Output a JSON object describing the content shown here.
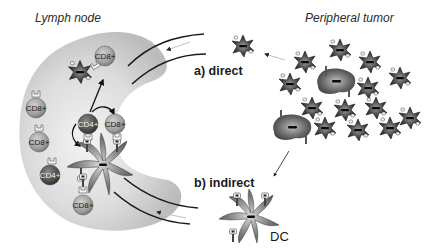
{
  "labels": {
    "lymph_node": "Lymph node",
    "peripheral_tumor": "Peripheral tumor",
    "direct": "a) direct",
    "indirect": "b) indirect",
    "dc": "DC"
  },
  "cells": {
    "cd8_top": "CD8+",
    "cd8_left1": "CD8+",
    "cd8_left2": "CD8+",
    "cd4_center": "CD4+",
    "cd8_center": "CD8+",
    "cd4_left": "CD4+",
    "cd8_bottom": "CD8+"
  },
  "colors": {
    "lymph_node_fill": "#c8c8c8",
    "lymph_node_inner": "#ececec",
    "cd8_fill": "#9a9a9a",
    "cd4_fill": "#4a4a4a",
    "tumor_fill": "#3a3a3a",
    "vessel_stroke": "#1a1a1a",
    "flow_arrow": "#bdbdbd"
  }
}
